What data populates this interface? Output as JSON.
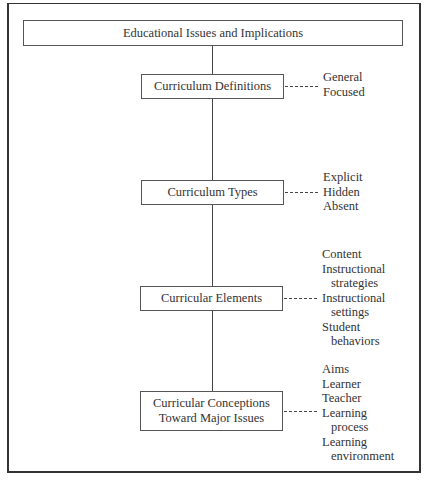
{
  "diagram": {
    "root": {
      "label": "Educational Issues and Implications"
    },
    "nodes": [
      {
        "label": "Curriculum Definitions",
        "items": [
          {
            "text": "General",
            "indent": false
          },
          {
            "text": "Focused",
            "indent": false
          }
        ]
      },
      {
        "label": "Curriculum Types",
        "items": [
          {
            "text": "Explicit",
            "indent": false
          },
          {
            "text": "Hidden",
            "indent": false
          },
          {
            "text": "Absent",
            "indent": false
          }
        ]
      },
      {
        "label": "Curricular Elements",
        "items": [
          {
            "text": "Content",
            "indent": false
          },
          {
            "text": "Instructional",
            "indent": false
          },
          {
            "text": "strategies",
            "indent": true
          },
          {
            "text": "Instructional",
            "indent": false
          },
          {
            "text": "settings",
            "indent": true
          },
          {
            "text": "Student",
            "indent": false
          },
          {
            "text": "behaviors",
            "indent": true
          }
        ]
      },
      {
        "label_line1": "Curricular Conceptions",
        "label_line2": "Toward Major Issues",
        "items": [
          {
            "text": "Aims",
            "indent": false
          },
          {
            "text": "Learner",
            "indent": false
          },
          {
            "text": "Teacher",
            "indent": false
          },
          {
            "text": "Learning",
            "indent": false
          },
          {
            "text": "process",
            "indent": true
          },
          {
            "text": "Learning",
            "indent": false
          },
          {
            "text": "environment",
            "indent": true
          }
        ]
      }
    ]
  },
  "colors": {
    "line": "#444444",
    "border": "#555555",
    "text": "#333333",
    "background": "#ffffff"
  }
}
